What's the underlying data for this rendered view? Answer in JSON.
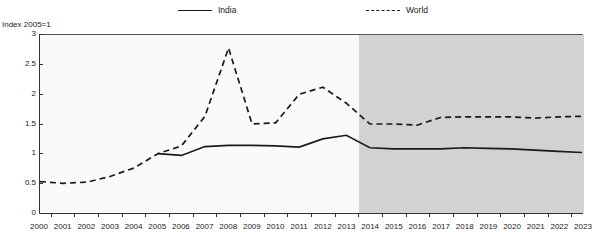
{
  "legend": {
    "entries": [
      {
        "label": "India",
        "style": "solid",
        "color": "#1a1a1a"
      },
      {
        "label": "World",
        "style": "dashed",
        "color": "#1a1a1a"
      }
    ]
  },
  "axis_title": "Index 2005=1",
  "colors": {
    "line": "#1a1a1a",
    "plot_background": "#fafafa",
    "forecast_background": "#d2d2d2",
    "axis": "#333333"
  },
  "chart_data": {
    "type": "line",
    "title": "",
    "subtitle": "",
    "xlabel": "",
    "ylabel": "Index 2005=1",
    "ylim": [
      0,
      3
    ],
    "xlim": [
      2000,
      2023
    ],
    "yticks": [
      0,
      0.5,
      1,
      1.5,
      2,
      2.5,
      3
    ],
    "ytick_labels": [
      "0",
      "0.5",
      "1",
      "1.5",
      "2",
      "2.5",
      "3"
    ],
    "grid": false,
    "legend_position": "top",
    "x": [
      2000,
      2001,
      2002,
      2003,
      2004,
      2005,
      2006,
      2007,
      2008,
      2009,
      2010,
      2011,
      2012,
      2013,
      2014,
      2015,
      2016,
      2017,
      2018,
      2019,
      2020,
      2021,
      2022,
      2023
    ],
    "categories": [
      "2000",
      "2001",
      "2002",
      "2003",
      "2004",
      "2005",
      "2006",
      "2007",
      "2008",
      "2009",
      "2010",
      "2011",
      "2012",
      "2013",
      "2014",
      "2015",
      "2016",
      "2017",
      "2018",
      "2019",
      "2020",
      "2021",
      "2022",
      "2023"
    ],
    "series": [
      {
        "name": "India",
        "style": "solid",
        "color": "#1a1a1a",
        "values": [
          null,
          null,
          null,
          null,
          null,
          1.0,
          0.97,
          1.12,
          1.14,
          1.14,
          1.13,
          1.11,
          1.25,
          1.31,
          1.1,
          1.08,
          1.08,
          1.08,
          1.1,
          1.09,
          1.08,
          1.06,
          1.04,
          1.02
        ]
      },
      {
        "name": "World",
        "style": "dashed",
        "color": "#1a1a1a",
        "values": [
          0.53,
          0.5,
          0.52,
          0.62,
          0.76,
          1.0,
          1.13,
          1.63,
          2.78,
          1.5,
          1.52,
          2.0,
          2.12,
          1.85,
          1.5,
          1.5,
          1.48,
          1.61,
          1.62,
          1.62,
          1.62,
          1.6,
          1.62,
          1.63
        ]
      }
    ],
    "annotations": [
      {
        "type": "shaded-region",
        "label": "forecast",
        "x_start": 2013.5,
        "x_end": 2023,
        "color": "#d2d2d2"
      }
    ]
  }
}
